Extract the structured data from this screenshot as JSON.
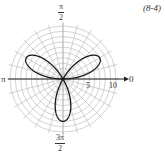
{
  "label": "(8-4)",
  "angle_labels": {
    "top": {
      "num": "π",
      "den": "2"
    },
    "bottom": {
      "num": "3π",
      "den": "2"
    },
    "left": "π",
    "right": "0"
  },
  "radial_tick_labels": [
    "5",
    "10"
  ],
  "chart_data": {
    "type": "line",
    "subtype": "polar",
    "title": "",
    "equation": "r = 8 sin(3θ)",
    "petal_length": 8,
    "petal_directions_rad": [
      "π/6",
      "5π/6",
      "3π/2"
    ],
    "radial_ticks": [
      5,
      10
    ],
    "radial_range": [
      0,
      10
    ],
    "rings": 10,
    "angular_gridlines_deg": 15,
    "angle_labels": [
      "0",
      "π/2",
      "π",
      "3π/2"
    ],
    "grid": true,
    "colors": {
      "curve": "#1a1a1a",
      "grid": "#b5b5b5",
      "axis": "#222222"
    }
  }
}
